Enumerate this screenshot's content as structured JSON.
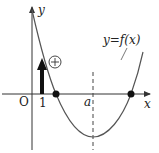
{
  "diagram": {
    "type": "function-graph",
    "axes": {
      "x_label": "x",
      "y_label": "y",
      "origin_label": "O"
    },
    "ticks": {
      "x_one": "1",
      "x_a": "a"
    },
    "curve": {
      "label_y": "y",
      "label_eq": "=",
      "label_f": "f",
      "label_arg": "(x)",
      "color": "#555555"
    },
    "annotation": {
      "sign": "+"
    },
    "colors": {
      "axis": "#333333",
      "arrow": "#111111",
      "dot": "#111111",
      "dashed": "#444444"
    }
  }
}
